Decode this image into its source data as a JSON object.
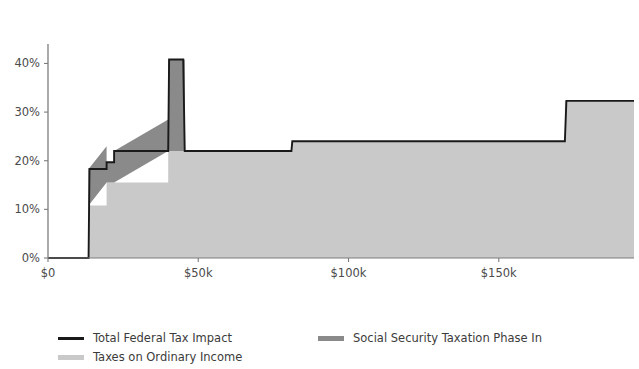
{
  "chart_data": {
    "type": "area",
    "title": "",
    "subtitle": "",
    "xlabel": "",
    "ylabel": "",
    "xlim": [
      0,
      195000
    ],
    "ylim": [
      0,
      44
    ],
    "grid": false,
    "stacked": true,
    "legend_position": "bottom-left",
    "x_ticks": [
      {
        "value": 0,
        "label": "$0"
      },
      {
        "value": 50000,
        "label": "$50k"
      },
      {
        "value": 100000,
        "label": "$100k"
      },
      {
        "value": 150000,
        "label": "$150k"
      }
    ],
    "y_ticks": [
      {
        "value": 0,
        "label": "0%"
      },
      {
        "value": 10,
        "label": "10%"
      },
      {
        "value": 20,
        "label": "20%"
      },
      {
        "value": 30,
        "label": "30%"
      },
      {
        "value": 40,
        "label": "40%"
      }
    ],
    "legend": [
      {
        "name": "Total Federal Tax Impact",
        "type": "line",
        "color": "#1a1a1a"
      },
      {
        "name": "Social Security Taxation Phase In",
        "type": "area",
        "color": "#8a8a8a"
      },
      {
        "name": "Taxes on Ordinary Income",
        "type": "area",
        "color": "#c9c9c9"
      }
    ],
    "series": [
      {
        "name": "Taxes on Ordinary Income",
        "color": "#c9c9c9",
        "x": [
          0,
          13500,
          13500,
          19500,
          19500,
          40000,
          40000,
          45500,
          45500,
          81000,
          81000,
          172000,
          172000,
          195000
        ],
        "values": [
          0,
          0,
          10.8,
          10.8,
          15.5,
          15.5,
          22.0,
          22.0,
          22.0,
          22.0,
          24.0,
          24.0,
          32.3,
          32.3
        ]
      },
      {
        "name": "Social Security Taxation Phase In",
        "color": "#8a8a8a",
        "x": [
          0,
          13500,
          13500,
          19500,
          19500,
          22000,
          22000,
          40000,
          40000,
          45500,
          45500,
          195000
        ],
        "values": [
          0,
          0,
          7.5,
          7.5,
          4.2,
          4.2,
          6.5,
          6.5,
          18.8,
          18.8,
          0,
          0
        ]
      }
    ],
    "total_line": {
      "name": "Total Federal Tax Impact",
      "color": "#1a1a1a",
      "x": [
        0,
        13500,
        13800,
        19500,
        19500,
        22000,
        22000,
        40000,
        40300,
        45000,
        45500,
        81000,
        81300,
        172000,
        172500,
        195000
      ],
      "values": [
        0,
        0,
        18.3,
        18.3,
        19.7,
        19.7,
        22.0,
        22.0,
        40.8,
        40.8,
        22.0,
        22.0,
        24.0,
        24.0,
        32.3,
        32.3
      ]
    },
    "annotations": []
  },
  "legend_text": {
    "total_federal_tax_impact": "Total Federal Tax Impact",
    "social_security_taxation_phase_in": "Social Security Taxation Phase In",
    "taxes_on_ordinary_income": "Taxes on Ordinary Income"
  },
  "colors": {
    "line": "#1a1a1a",
    "phase_in_fill": "#8a8a8a",
    "ordinary_income_fill": "#c9c9c9",
    "axis": "#7d7d7d",
    "text": "#3b3b3b",
    "background": "#ffffff"
  }
}
